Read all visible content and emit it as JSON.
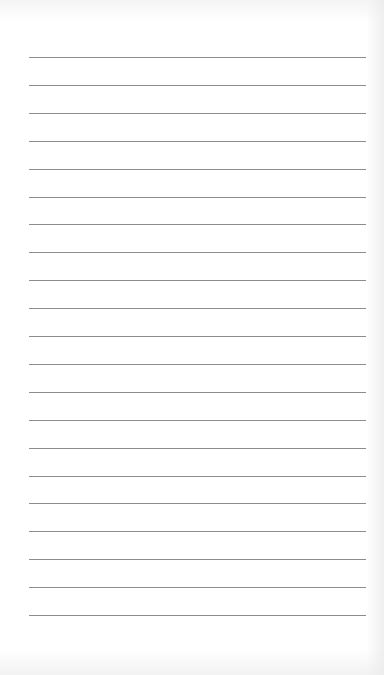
{
  "sheet": {
    "type": "lined-paper",
    "line_count": 21,
    "first_line_y": 57,
    "line_spacing": 27.9,
    "line_left": 29,
    "line_width": 337,
    "line_color": "#8c8c8c",
    "background_color": "#ffffff"
  }
}
